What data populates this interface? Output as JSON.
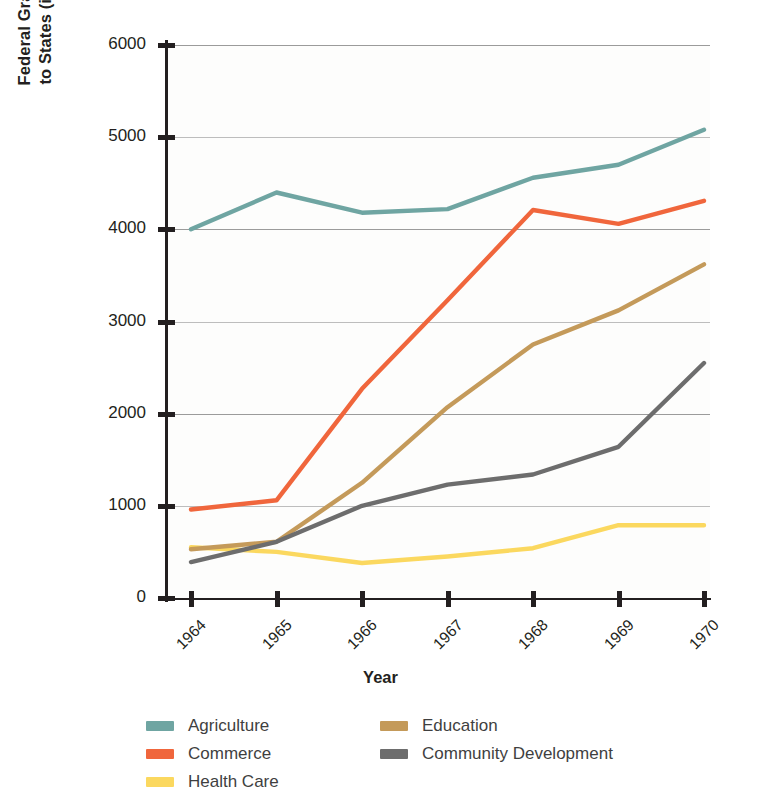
{
  "chart_data": {
    "type": "line",
    "title": "",
    "xlabel": "Year",
    "ylabel": "Federal Grants-in-Aid\nto States (in millions)",
    "categories": [
      "1964",
      "1965",
      "1966",
      "1967",
      "1968",
      "1969",
      "1970"
    ],
    "ylim": [
      0,
      6000
    ],
    "yticks": [
      0,
      1000,
      2000,
      3000,
      4000,
      5000,
      6000
    ],
    "ytick_labels": [
      "0",
      "1000",
      "2000",
      "3000",
      "4000",
      "5000",
      "6000"
    ],
    "grid": true,
    "legend_position": "bottom-left",
    "series": [
      {
        "name": "Agriculture",
        "color": "#6fa5a2",
        "values": [
          4000,
          4400,
          4180,
          4220,
          4560,
          4700,
          5080
        ]
      },
      {
        "name": "Commerce",
        "color": "#f0663c",
        "values": [
          960,
          1060,
          2270,
          3230,
          4210,
          4060,
          4310
        ]
      },
      {
        "name": "Health Care",
        "color": "#fbd85f",
        "values": [
          550,
          500,
          380,
          450,
          540,
          790,
          790
        ]
      },
      {
        "name": "Education",
        "color": "#c49a5a",
        "values": [
          530,
          610,
          1250,
          2070,
          2750,
          3120,
          3620
        ]
      },
      {
        "name": "Community Development",
        "color": "#6d6d6d",
        "values": [
          390,
          610,
          1000,
          1230,
          1340,
          1640,
          2550
        ]
      }
    ]
  },
  "axis": {
    "y_title_line1": "Federal Grants-in-Aid",
    "y_title_line2": "to States (in millions)",
    "x_title": "Year"
  },
  "legend": {
    "column1": [
      {
        "label": "Agriculture",
        "color": "#6fa5a2"
      },
      {
        "label": "Commerce",
        "color": "#f0663c"
      },
      {
        "label": "Health Care",
        "color": "#fbd85f"
      }
    ],
    "column2": [
      {
        "label": "Education",
        "color": "#c49a5a"
      },
      {
        "label": "Community Development",
        "color": "#6d6d6d"
      }
    ]
  }
}
